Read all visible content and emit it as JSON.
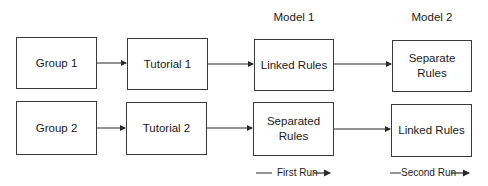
{
  "headers": {
    "model1": "Model 1",
    "model2": "Model 2"
  },
  "rows": [
    {
      "group": "Group 1",
      "tutorial": "Tutorial 1",
      "first_run": "Linked Rules",
      "second_run": "Separate Rules"
    },
    {
      "group": "Group 2",
      "tutorial": "Tutorial 2",
      "first_run": "Separated Rules",
      "second_run": "Linked Rules"
    }
  ],
  "runs": {
    "first": "First Run",
    "second": "Second Run"
  }
}
